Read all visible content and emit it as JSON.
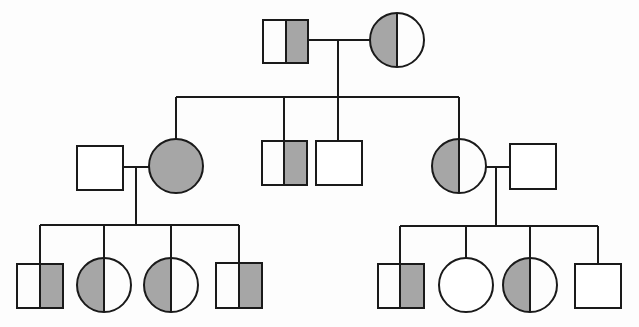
{
  "diagram": {
    "type": "pedigree",
    "description": "Three-generation pedigree chart; grey half-fill indicates carrier status",
    "colors": {
      "affected_fill": "#a6a6a6",
      "unaffected_fill": "#ffffff",
      "stroke": "#1a1a1a"
    },
    "legend": {
      "half_grey": "carrier",
      "full_grey": "affected",
      "white": "unaffected"
    },
    "generations": [
      {
        "label": "I",
        "individuals": [
          {
            "id": "I-1",
            "sex": "male",
            "status": "carrier",
            "fill": "right-half"
          },
          {
            "id": "I-2",
            "sex": "female",
            "status": "carrier",
            "fill": "left-half"
          }
        ]
      },
      {
        "label": "II",
        "individuals": [
          {
            "id": "II-spouse-1",
            "sex": "male",
            "status": "unaffected",
            "fill": "none"
          },
          {
            "id": "II-1",
            "sex": "female",
            "status": "affected",
            "fill": "full"
          },
          {
            "id": "II-2",
            "sex": "male",
            "status": "carrier",
            "fill": "right-half"
          },
          {
            "id": "II-3",
            "sex": "male",
            "status": "unaffected",
            "fill": "none"
          },
          {
            "id": "II-4",
            "sex": "female",
            "status": "carrier",
            "fill": "left-half"
          },
          {
            "id": "II-spouse-2",
            "sex": "male",
            "status": "unaffected",
            "fill": "none"
          }
        ]
      },
      {
        "label": "III",
        "individuals": [
          {
            "id": "III-1",
            "sex": "male",
            "status": "carrier",
            "fill": "right-half"
          },
          {
            "id": "III-2",
            "sex": "female",
            "status": "carrier",
            "fill": "left-half"
          },
          {
            "id": "III-3",
            "sex": "female",
            "status": "carrier",
            "fill": "left-half"
          },
          {
            "id": "III-4",
            "sex": "male",
            "status": "carrier",
            "fill": "right-half"
          },
          {
            "id": "III-5",
            "sex": "male",
            "status": "carrier",
            "fill": "right-half"
          },
          {
            "id": "III-6",
            "sex": "female",
            "status": "unaffected",
            "fill": "none"
          },
          {
            "id": "III-7",
            "sex": "female",
            "status": "carrier",
            "fill": "left-half"
          },
          {
            "id": "III-8",
            "sex": "male",
            "status": "unaffected",
            "fill": "none"
          }
        ]
      }
    ]
  }
}
